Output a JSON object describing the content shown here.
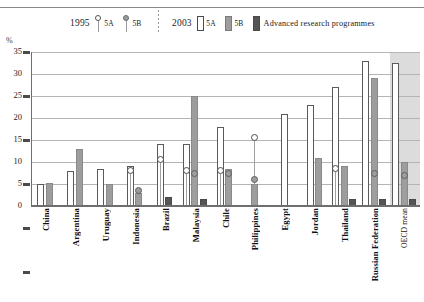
{
  "axis": {
    "unit_label": "%",
    "y_ticks": [
      "35",
      "30",
      "25",
      "20",
      "15",
      "10",
      "5",
      "0"
    ]
  },
  "legend": {
    "year_1995": "1995",
    "year_2003": "2003",
    "items_1995": [
      {
        "label": "5A",
        "marker": "open-circle-marker"
      },
      {
        "label": "5B",
        "marker": "filled-circle-marker"
      }
    ],
    "items_2003": [
      {
        "label": "5A",
        "swatch": "white-bar-swatch"
      },
      {
        "label": "5B",
        "swatch": "gray-bar-swatch"
      },
      {
        "label": "Advanced research programmes",
        "swatch": "dark-bar-swatch"
      }
    ]
  },
  "chart_data": {
    "type": "bar",
    "title": "",
    "xlabel": "",
    "ylabel": "%",
    "ylim": [
      0,
      35
    ],
    "ytick_step": 5,
    "grid": true,
    "legend_position": "top",
    "categories": [
      "China",
      "Argentina",
      "Uruguay",
      "Indonesia",
      "Brazil",
      "Malaysia",
      "Chile",
      "Philippines",
      "Egypt",
      "Jordan",
      "Thailand",
      "Russian Federation",
      "OECD mean"
    ],
    "highlighted_category": "OECD mean",
    "series": [
      {
        "name": "2003 5A",
        "kind": "bar",
        "color": "#ffffff",
        "values": [
          5.0,
          8.0,
          8.5,
          9.0,
          14.0,
          14.0,
          18.0,
          null,
          21.0,
          23.0,
          27.0,
          33.0,
          32.5
        ]
      },
      {
        "name": "2003 5B",
        "kind": "bar",
        "color": "#9d9d9d",
        "values": [
          5.2,
          13.0,
          5.0,
          3.0,
          null,
          25.0,
          8.5,
          5.0,
          null,
          11.0,
          9.0,
          29.0,
          10.0
        ]
      },
      {
        "name": "2003 Advanced research programmes",
        "kind": "bar",
        "color": "#555555",
        "values": [
          null,
          null,
          null,
          null,
          2.0,
          1.5,
          null,
          null,
          null,
          null,
          1.5,
          1.5,
          1.5
        ]
      },
      {
        "name": "1995 5A",
        "kind": "marker-open",
        "color": "#ffffff",
        "values": [
          null,
          null,
          null,
          8.0,
          10.5,
          8.0,
          8.0,
          15.5,
          null,
          null,
          8.5,
          null,
          null
        ]
      },
      {
        "name": "1995 5B",
        "kind": "marker-filled",
        "color": "#9d9d9d",
        "values": [
          null,
          null,
          null,
          3.5,
          null,
          7.5,
          7.5,
          6.0,
          null,
          null,
          null,
          7.5,
          7.0
        ]
      }
    ]
  }
}
